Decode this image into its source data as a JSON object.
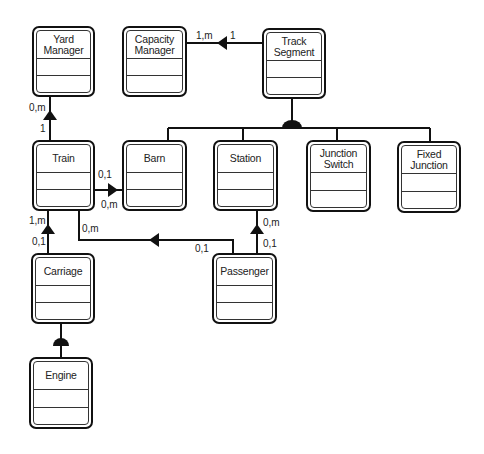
{
  "diagram": {
    "type": "class-diagram",
    "classes": [
      {
        "id": "yard-manager",
        "name": "Yard\nManager"
      },
      {
        "id": "capacity-manager",
        "name": "Capacity\nManager"
      },
      {
        "id": "track-segment",
        "name": "Track\nSegment"
      },
      {
        "id": "train",
        "name": "Train"
      },
      {
        "id": "barn",
        "name": "Barn"
      },
      {
        "id": "station",
        "name": "Station"
      },
      {
        "id": "junction-switch",
        "name": "Junction\nSwitch"
      },
      {
        "id": "fixed-junction",
        "name": "Fixed\nJunction"
      },
      {
        "id": "carriage",
        "name": "Carriage"
      },
      {
        "id": "passenger",
        "name": "Passenger"
      },
      {
        "id": "engine",
        "name": "Engine"
      }
    ],
    "associations": [
      {
        "from": "Train",
        "to": "Yard Manager",
        "from_mult": "1",
        "to_mult": "0,m"
      },
      {
        "from": "Track Segment",
        "to": "Capacity Manager",
        "from_mult": "1",
        "to_mult": "1,m"
      },
      {
        "from": "Train",
        "to": "Barn",
        "from_mult": "0,m",
        "to_mult": "0,1"
      },
      {
        "from": "Carriage",
        "to": "Train",
        "from_mult": "0,1",
        "to_mult": "1,m"
      },
      {
        "from": "Passenger",
        "to": "Train",
        "from_mult": "0,1",
        "to_mult": "0,m"
      },
      {
        "from": "Passenger",
        "to": "Station",
        "from_mult": "0,1",
        "to_mult": "0,m"
      }
    ],
    "generalizations": [
      {
        "parent": "Track Segment",
        "children": [
          "Barn",
          "Station",
          "Junction Switch",
          "Fixed Junction"
        ]
      },
      {
        "parent": "Carriage",
        "children": [
          "Engine"
        ]
      }
    ],
    "multiplicities": {
      "yard_train_top": "0,m",
      "yard_train_bottom": "1",
      "capacity_near": "1,m",
      "capacity_far": "1",
      "barn_top": "0,1",
      "barn_bottom": "0,m",
      "train_carriage_top": "1,m",
      "train_carriage_bottom": "0,1",
      "train_passenger_train": "0,m",
      "train_passenger_passenger": "0,1",
      "station_passenger_top": "0,m",
      "station_passenger_bottom": "0,1"
    }
  }
}
